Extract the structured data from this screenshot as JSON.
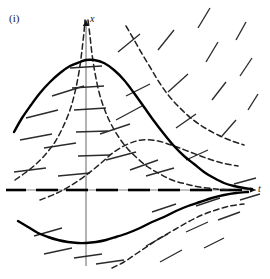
{
  "figure": {
    "panel_label": "(i)",
    "type": "direction-field-with-solution-curves",
    "background_color": "#ffffff",
    "ink_color": "#111111",
    "solid_curve_color": "#000000",
    "dashed_curve_color": "#222222",
    "slope_dash_color": "#2b2b2b",
    "axis_color": "#555555"
  },
  "axes": {
    "vertical": {
      "label": "x",
      "x_px": 86,
      "top_px": 20,
      "bottom_px": 266,
      "arrow": "up"
    },
    "horizontal": {
      "label": "t",
      "y_px": 190,
      "left_px": 6,
      "right_px": 256,
      "arrow": "right",
      "rendered_as": "dashed-equilibrium-line"
    },
    "origin_px": [
      86,
      190
    ]
  },
  "chart_data": {
    "type": "line",
    "title": "",
    "xlabel": "t",
    "ylabel": "x",
    "grid": false,
    "legend": false,
    "xlim": [
      -2.2,
      4.2
    ],
    "ylim": [
      -1.6,
      3.2
    ],
    "annotations": [
      "(i)"
    ],
    "equilibrium_solution": {
      "description": "x = 0 is an equilibrium solution drawn as a dashed horizontal line along the t-axis",
      "value": 0
    },
    "series": [
      {
        "name": "solution-curve-upper-solid",
        "style": "solid",
        "width": 2.4,
        "points_px": [
          [
            14,
            132
          ],
          [
            22,
            118
          ],
          [
            31,
            105
          ],
          [
            40,
            93
          ],
          [
            50,
            82
          ],
          [
            60,
            73
          ],
          [
            70,
            66
          ],
          [
            80,
            62
          ],
          [
            86,
            60
          ],
          [
            94,
            60
          ],
          [
            104,
            63
          ],
          [
            114,
            70
          ],
          [
            124,
            80
          ],
          [
            134,
            93
          ],
          [
            144,
            107
          ],
          [
            154,
            121
          ],
          [
            164,
            134
          ],
          [
            174,
            146
          ],
          [
            184,
            156
          ],
          [
            194,
            164
          ],
          [
            204,
            172
          ],
          [
            214,
            178
          ],
          [
            224,
            183
          ],
          [
            234,
            186
          ],
          [
            244,
            188
          ],
          [
            252,
            189
          ]
        ]
      },
      {
        "name": "solution-curve-lower-solid",
        "style": "solid",
        "width": 2.4,
        "points_px": [
          [
            18,
            221
          ],
          [
            28,
            227
          ],
          [
            38,
            233
          ],
          [
            48,
            237
          ],
          [
            58,
            240
          ],
          [
            68,
            242
          ],
          [
            78,
            243
          ],
          [
            86,
            243
          ],
          [
            96,
            242
          ],
          [
            106,
            240
          ],
          [
            116,
            237
          ],
          [
            128,
            233
          ],
          [
            140,
            228
          ],
          [
            152,
            222
          ],
          [
            164,
            217
          ],
          [
            176,
            211
          ],
          [
            188,
            206
          ],
          [
            200,
            202
          ],
          [
            212,
            198
          ],
          [
            224,
            195
          ],
          [
            236,
            193
          ],
          [
            248,
            192
          ]
        ]
      },
      {
        "name": "solution-curve-upper-dashed-steep",
        "style": "dashed",
        "width": 1.5,
        "points_px": [
          [
            15,
            180
          ],
          [
            25,
            173
          ],
          [
            35,
            165
          ],
          [
            45,
            155
          ],
          [
            55,
            142
          ],
          [
            63,
            127
          ],
          [
            70,
            110
          ],
          [
            75,
            92
          ],
          [
            79,
            72
          ],
          [
            82,
            50
          ],
          [
            84,
            32
          ],
          [
            85,
            20
          ]
        ]
      },
      {
        "name": "solution-curve-upper-dashed-steep-right",
        "style": "dashed",
        "width": 1.5,
        "points_px": [
          [
            88,
            20
          ],
          [
            90,
            36
          ],
          [
            92,
            54
          ],
          [
            95,
            73
          ],
          [
            99,
            92
          ],
          [
            104,
            108
          ],
          [
            110,
            122
          ],
          [
            118,
            136
          ],
          [
            127,
            148
          ],
          [
            137,
            158
          ],
          [
            148,
            167
          ],
          [
            160,
            174
          ],
          [
            172,
            180
          ],
          [
            186,
            184
          ],
          [
            200,
            187
          ],
          [
            216,
            189
          ],
          [
            230,
            190
          ]
        ]
      },
      {
        "name": "solution-curve-dashed-right-upper",
        "style": "dashed",
        "width": 1.5,
        "points_px": [
          [
            126,
            26
          ],
          [
            133,
            38
          ],
          [
            141,
            52
          ],
          [
            150,
            67
          ],
          [
            159,
            82
          ],
          [
            169,
            96
          ],
          [
            180,
            108
          ],
          [
            192,
            119
          ],
          [
            205,
            128
          ],
          [
            218,
            135
          ],
          [
            232,
            141
          ],
          [
            244,
            145
          ]
        ]
      },
      {
        "name": "solution-curve-dashed-midright",
        "style": "dashed",
        "width": 1.5,
        "points_px": [
          [
            40,
            200
          ],
          [
            55,
            194
          ],
          [
            70,
            186
          ],
          [
            85,
            176
          ],
          [
            100,
            164
          ],
          [
            114,
            152
          ],
          [
            128,
            144
          ],
          [
            142,
            140
          ],
          [
            158,
            141
          ],
          [
            174,
            146
          ],
          [
            190,
            152
          ],
          [
            206,
            158
          ],
          [
            222,
            163
          ],
          [
            238,
            166
          ]
        ]
      },
      {
        "name": "solution-curve-dashed-lower",
        "style": "dashed",
        "width": 1.5,
        "points_px": [
          [
            112,
            268
          ],
          [
            124,
            262
          ],
          [
            136,
            254
          ],
          [
            148,
            246
          ],
          [
            160,
            238
          ],
          [
            174,
            230
          ],
          [
            188,
            222
          ],
          [
            202,
            215
          ],
          [
            216,
            210
          ],
          [
            230,
            206
          ],
          [
            244,
            204
          ]
        ]
      }
    ],
    "slope_field": {
      "description": "Short straight dashes showing local solution slope; horizontal near x-axis and near the upper crest, steepening negative on the right.",
      "segments_px": [
        [
          52,
          96,
          84,
          86
        ],
        [
          20,
          140,
          52,
          134
        ],
        [
          44,
          148,
          76,
          143
        ],
        [
          14,
          172,
          46,
          168
        ],
        [
          58,
          176,
          90,
          173
        ],
        [
          26,
          118,
          58,
          110
        ],
        [
          70,
          68,
          102,
          66
        ],
        [
          72,
          88,
          104,
          86
        ],
        [
          74,
          110,
          106,
          108
        ],
        [
          76,
          132,
          108,
          131
        ],
        [
          78,
          156,
          110,
          155
        ],
        [
          100,
          134,
          130,
          124
        ],
        [
          106,
          160,
          136,
          152
        ],
        [
          118,
          52,
          140,
          34
        ],
        [
          126,
          96,
          150,
          84
        ],
        [
          130,
          170,
          158,
          160
        ],
        [
          146,
          176,
          174,
          168
        ],
        [
          116,
          120,
          142,
          106
        ],
        [
          158,
          50,
          174,
          30
        ],
        [
          168,
          92,
          188,
          74
        ],
        [
          176,
          128,
          196,
          114
        ],
        [
          186,
          160,
          208,
          150
        ],
        [
          198,
          28,
          210,
          8
        ],
        [
          206,
          62,
          218,
          42
        ],
        [
          212,
          100,
          226,
          82
        ],
        [
          222,
          136,
          236,
          120
        ],
        [
          236,
          40,
          246,
          22
        ],
        [
          240,
          76,
          252,
          58
        ],
        [
          248,
          110,
          258,
          94
        ],
        [
          34,
          236,
          62,
          228
        ],
        [
          44,
          254,
          72,
          248
        ],
        [
          74,
          258,
          102,
          254
        ],
        [
          96,
          264,
          124,
          260
        ],
        [
          146,
          246,
          168,
          234
        ],
        [
          160,
          262,
          182,
          250
        ],
        [
          186,
          232,
          208,
          222
        ],
        [
          204,
          248,
          224,
          238
        ],
        [
          196,
          206,
          220,
          198
        ],
        [
          218,
          220,
          240,
          212
        ],
        [
          152,
          212,
          176,
          204
        ],
        [
          234,
          184,
          256,
          178
        ],
        [
          240,
          200,
          260,
          194
        ]
      ],
      "equilibrium_dashes_px": [
        [
          6,
          190,
          26,
          190
        ],
        [
          36,
          190,
          58,
          190
        ],
        [
          66,
          190,
          88,
          190
        ],
        [
          96,
          190,
          118,
          190
        ],
        [
          128,
          190,
          150,
          190
        ],
        [
          158,
          190,
          180,
          190
        ],
        [
          190,
          190,
          212,
          190
        ],
        [
          220,
          190,
          242,
          190
        ]
      ]
    }
  }
}
